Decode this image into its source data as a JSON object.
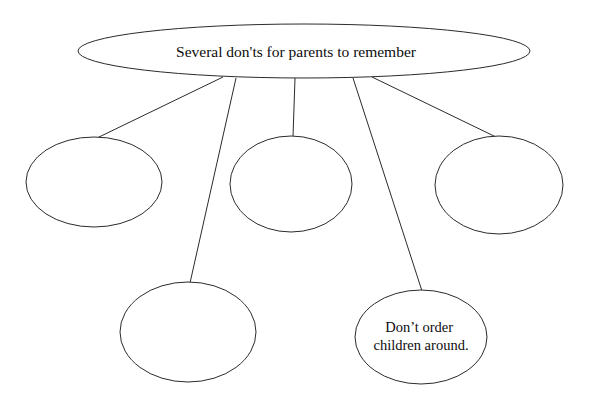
{
  "diagram": {
    "type": "cluster-web-organizer",
    "background_color": "#ffffff",
    "stroke_color": "#2b2b2b",
    "text_color": "#0d0d0d",
    "root": {
      "id": "root-topic",
      "label": "Several don'ts for parents to remember",
      "shape": "ellipse",
      "cx": 304,
      "cy": 51,
      "rx": 226,
      "ry": 27
    },
    "branches": [
      {
        "id": "branch-1",
        "label": "",
        "shape": "ellipse",
        "cx": 94,
        "cy": 182,
        "rx": 68,
        "ry": 45,
        "lines": []
      },
      {
        "id": "branch-2",
        "label": "",
        "shape": "ellipse",
        "cx": 188,
        "cy": 332,
        "rx": 68,
        "ry": 50,
        "lines": []
      },
      {
        "id": "branch-3",
        "label": "",
        "shape": "ellipse",
        "cx": 291,
        "cy": 184,
        "rx": 61,
        "ry": 48,
        "lines": []
      },
      {
        "id": "branch-4",
        "label": "Don't order children around.",
        "shape": "ellipse",
        "cx": 421,
        "cy": 337,
        "rx": 66,
        "ry": 47,
        "lines": [
          "Don’t order",
          "children around."
        ]
      },
      {
        "id": "branch-5",
        "label": "",
        "shape": "ellipse",
        "cx": 499,
        "cy": 185,
        "rx": 64,
        "ry": 49,
        "lines": []
      }
    ],
    "connectors": [
      {
        "id": "connector-root-to-branch-1",
        "from": "root-topic",
        "to": "branch-1",
        "x1": 223,
        "y1": 77,
        "x2": 97,
        "y2": 138
      },
      {
        "id": "connector-root-to-branch-2",
        "from": "root-topic",
        "to": "branch-2",
        "x1": 236,
        "y1": 78,
        "x2": 190,
        "y2": 283
      },
      {
        "id": "connector-root-to-branch-3",
        "from": "root-topic",
        "to": "branch-3",
        "x1": 295,
        "y1": 78,
        "x2": 293,
        "y2": 137
      },
      {
        "id": "connector-root-to-branch-4",
        "from": "root-topic",
        "to": "branch-4",
        "x1": 353,
        "y1": 78,
        "x2": 422,
        "y2": 291
      },
      {
        "id": "connector-root-to-branch-5",
        "from": "root-topic",
        "to": "branch-5",
        "x1": 372,
        "y1": 77,
        "x2": 496,
        "y2": 137
      }
    ]
  }
}
